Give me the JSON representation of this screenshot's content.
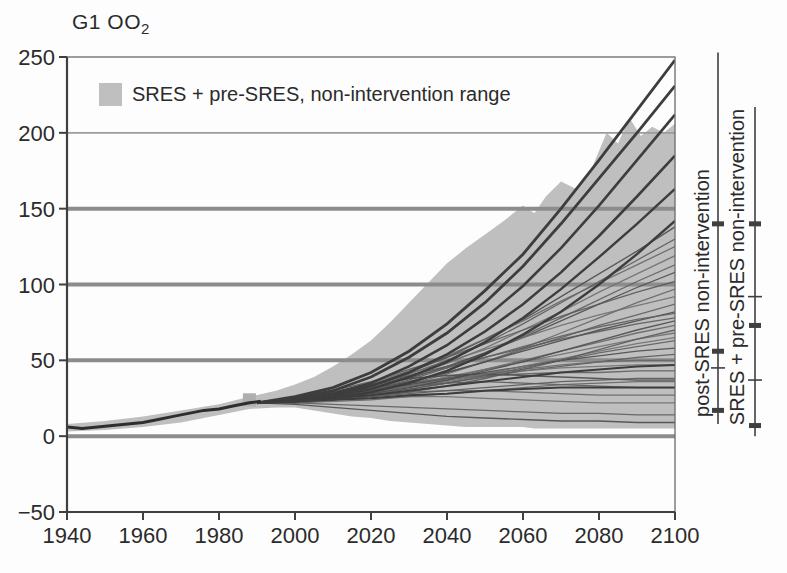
{
  "title": {
    "text": "G1 OO",
    "sub": "2"
  },
  "legend": {
    "label": "SRES + pre-SRES, non-intervention range",
    "swatch_color": "#bfbfbf"
  },
  "colors": {
    "background": "#fdfdfd",
    "axis": "#3f3f3f",
    "border": "#6a6a6a",
    "grid_thin": "#9b9b9b",
    "grid_thick": "#8c8c8c",
    "envelope_fill": "#bfbfbf",
    "historical_line": "#2e2e2e",
    "thick_line": "#3d3d3d",
    "marker_square": "#aeaeae",
    "text": "#2b2b2b",
    "thin_line_palette": [
      "#4d4d4d",
      "#5a5a5a",
      "#666666",
      "#707070",
      "#5f5f5f"
    ]
  },
  "chart_data": {
    "type": "line",
    "title": "G1 OO2",
    "xlabel": "",
    "ylabel": "",
    "x_axis": {
      "min": 1940,
      "max": 2100,
      "tick_labels": [
        "1940",
        "1960",
        "1980",
        "2000",
        "2020",
        "2040",
        "2060",
        "2080",
        "2100"
      ],
      "tick_values": [
        1940,
        1960,
        1980,
        2000,
        2020,
        2040,
        2060,
        2080,
        2100
      ]
    },
    "y_axis": {
      "min": -50,
      "max": 250,
      "tick_labels": [
        "−50",
        "0",
        "50",
        "100",
        "150",
        "200",
        "250"
      ],
      "tick_values": [
        -50,
        0,
        50,
        100,
        150,
        200,
        250
      ]
    },
    "gridlines": {
      "thin_at": [
        200
      ],
      "thick_at": [
        150,
        100,
        50,
        0
      ]
    },
    "legend_entries": [
      "SRES + pre-SRES, non-intervention range"
    ],
    "historical": {
      "name": "historical-emissions",
      "years": [
        1940,
        1944,
        1948,
        1952,
        1956,
        1960,
        1964,
        1968,
        1972,
        1976,
        1980,
        1984,
        1988,
        1991
      ],
      "values": [
        6,
        5,
        6,
        7,
        8,
        9,
        11,
        13,
        15,
        17,
        18,
        20,
        22,
        23
      ]
    },
    "fan_start_marker": {
      "year": 1988,
      "value": 24,
      "size_px": 13
    },
    "envelope": {
      "name": "SRES + pre-SRES non-intervention range",
      "years": [
        1940,
        1950,
        1960,
        1970,
        1980,
        1988,
        1995,
        2000,
        2005,
        2010,
        2015,
        2020,
        2025,
        2030,
        2035,
        2040,
        2045,
        2050,
        2055,
        2060,
        2063,
        2066,
        2070,
        2074,
        2078,
        2082,
        2085,
        2088,
        2091,
        2094,
        2097,
        2100
      ],
      "upper": [
        8,
        10,
        13,
        17,
        21,
        26,
        30,
        34,
        39,
        46,
        54,
        63,
        75,
        88,
        101,
        114,
        124,
        133,
        142,
        152,
        147,
        158,
        168,
        163,
        176,
        200,
        193,
        210,
        198,
        204,
        200,
        206
      ],
      "lower": [
        3,
        4,
        6,
        9,
        14,
        18,
        19,
        19,
        17,
        15,
        13,
        12,
        10,
        9,
        8,
        7,
        6,
        6,
        6,
        6,
        5,
        5,
        5,
        5,
        5,
        5,
        5,
        5,
        5,
        5,
        5,
        5
      ]
    },
    "scenario_years": [
      1990,
      2000,
      2010,
      2020,
      2030,
      2040,
      2050,
      2060,
      2070,
      2080,
      2090,
      2100
    ],
    "marker_scenarios": [
      {
        "name": "thick-scenario-1",
        "values": [
          22,
          26,
          32,
          42,
          56,
          74,
          96,
          120,
          150,
          182,
          215,
          248
        ],
        "width": 2.8
      },
      {
        "name": "thick-scenario-2",
        "values": [
          22,
          25,
          30,
          39,
          52,
          68,
          88,
          112,
          140,
          170,
          200,
          231
        ],
        "width": 2.8
      },
      {
        "name": "thick-scenario-3",
        "values": [
          22,
          24,
          28,
          35,
          46,
          60,
          78,
          99,
          124,
          152,
          182,
          212
        ],
        "width": 2.6
      },
      {
        "name": "thick-scenario-4",
        "values": [
          22,
          24,
          27,
          33,
          42,
          54,
          69,
          87,
          108,
          132,
          158,
          185
        ],
        "width": 2.6
      },
      {
        "name": "thick-scenario-5",
        "values": [
          22,
          23,
          26,
          31,
          39,
          49,
          62,
          78,
          97,
          118,
          140,
          163
        ],
        "width": 2.4
      },
      {
        "name": "thick-scenario-6",
        "values": [
          22,
          23,
          25,
          29,
          35,
          43,
          54,
          67,
          82,
          100,
          120,
          142
        ],
        "width": 2.4
      },
      {
        "name": "thick-scenario-7",
        "values": [
          22,
          23,
          25,
          27,
          30,
          33,
          36,
          39,
          42,
          44,
          46,
          47
        ],
        "width": 2.0
      },
      {
        "name": "thick-scenario-8",
        "values": [
          22,
          23,
          24,
          25,
          27,
          28,
          30,
          31,
          32,
          32,
          32,
          32
        ],
        "width": 2.0
      }
    ],
    "thin_scenarios": [
      [
        22,
        24,
        28,
        34,
        42,
        52,
        64,
        77,
        92,
        107,
        122,
        138
      ],
      [
        22,
        24,
        28,
        33,
        41,
        50,
        61,
        74,
        88,
        102,
        116,
        130
      ],
      [
        22,
        25,
        29,
        35,
        43,
        53,
        64,
        76,
        89,
        101,
        113,
        125
      ],
      [
        22,
        24,
        27,
        32,
        39,
        48,
        58,
        70,
        82,
        95,
        107,
        119
      ],
      [
        22,
        23,
        26,
        31,
        37,
        45,
        55,
        66,
        78,
        90,
        102,
        113
      ],
      [
        22,
        24,
        27,
        32,
        38,
        46,
        55,
        65,
        76,
        87,
        98,
        108
      ],
      [
        22,
        25,
        30,
        36,
        44,
        52,
        61,
        70,
        79,
        87,
        95,
        102
      ],
      [
        22,
        23,
        25,
        29,
        34,
        41,
        49,
        58,
        68,
        78,
        88,
        97
      ],
      [
        22,
        24,
        28,
        34,
        41,
        49,
        57,
        65,
        73,
        80,
        86,
        92
      ],
      [
        22,
        23,
        26,
        30,
        36,
        42,
        49,
        57,
        65,
        73,
        80,
        87
      ],
      [
        22,
        24,
        27,
        31,
        36,
        42,
        49,
        56,
        63,
        70,
        76,
        82
      ],
      [
        22,
        25,
        29,
        34,
        40,
        46,
        52,
        58,
        64,
        69,
        74,
        78
      ],
      [
        22,
        23,
        25,
        28,
        33,
        38,
        44,
        50,
        56,
        62,
        68,
        73
      ],
      [
        22,
        24,
        26,
        30,
        34,
        39,
        44,
        49,
        54,
        59,
        64,
        68
      ],
      [
        22,
        22,
        24,
        27,
        31,
        35,
        40,
        45,
        50,
        55,
        59,
        63
      ],
      [
        22,
        24,
        27,
        30,
        34,
        38,
        42,
        46,
        50,
        53,
        56,
        58
      ],
      [
        22,
        23,
        25,
        28,
        31,
        35,
        39,
        43,
        46,
        49,
        52,
        54
      ],
      [
        22,
        24,
        26,
        29,
        33,
        37,
        41,
        44,
        47,
        49,
        50,
        50
      ],
      [
        22,
        23,
        25,
        28,
        32,
        36,
        40,
        43,
        45,
        46,
        47,
        47
      ],
      [
        22,
        24,
        27,
        31,
        35,
        38,
        40,
        41,
        42,
        42,
        43,
        43
      ],
      [
        22,
        25,
        29,
        34,
        38,
        40,
        41,
        40,
        39,
        38,
        37,
        37
      ],
      [
        22,
        24,
        27,
        30,
        33,
        35,
        36,
        35,
        34,
        33,
        32,
        32
      ],
      [
        22,
        23,
        25,
        27,
        29,
        30,
        30,
        29,
        28,
        27,
        27,
        27
      ],
      [
        22,
        23,
        24,
        25,
        26,
        26,
        25,
        24,
        23,
        22,
        22,
        22
      ],
      [
        22,
        22,
        21,
        20,
        19,
        18,
        17,
        16,
        15,
        15,
        14,
        14
      ],
      [
        22,
        21,
        19,
        17,
        15,
        13,
        12,
        11,
        10,
        10,
        9,
        9
      ],
      [
        22,
        23,
        24,
        26,
        28,
        30,
        32,
        34,
        36,
        37,
        38,
        38
      ],
      [
        22,
        22,
        23,
        24,
        26,
        28,
        30,
        32,
        34,
        35,
        36,
        36
      ],
      [
        22,
        23,
        26,
        29,
        33,
        37,
        41,
        46,
        51,
        56,
        61,
        65
      ],
      [
        22,
        24,
        28,
        33,
        39,
        45,
        52,
        59,
        66,
        72,
        77,
        81
      ],
      [
        22,
        23,
        25,
        28,
        32,
        37,
        43,
        49,
        56,
        63,
        70,
        76
      ],
      [
        22,
        22,
        24,
        26,
        29,
        33,
        38,
        44,
        50,
        57,
        64,
        70
      ]
    ],
    "range_bars": [
      {
        "label": "post-SRES non-intervention",
        "x_px": 718,
        "top_value": 253,
        "bottom_value": 8,
        "thick_ticks": [
          140,
          56,
          17
        ],
        "thin_ticks": [
          45
        ]
      },
      {
        "label": "SRES + pre-SRES non-intervention",
        "x_px": 755,
        "top_value": 217,
        "bottom_value": 0,
        "thick_ticks": [
          140,
          73,
          7
        ],
        "thin_ticks": [
          92,
          37
        ]
      }
    ]
  }
}
